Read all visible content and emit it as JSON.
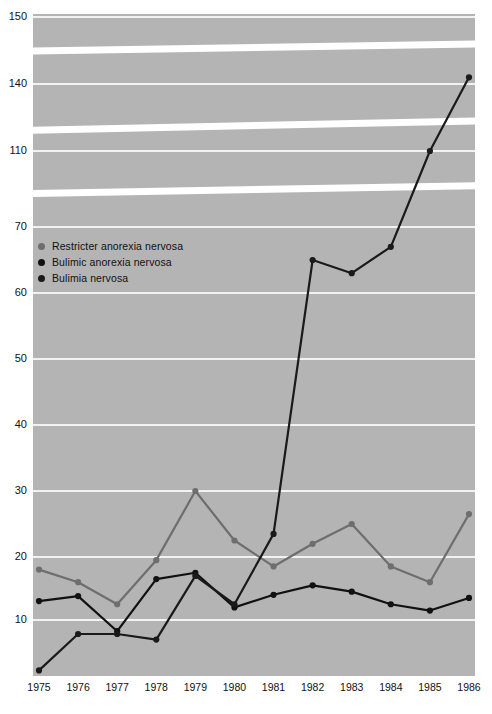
{
  "chart_data": {
    "type": "line",
    "title": "",
    "subtitle": "",
    "xlabel": "",
    "ylabel": "",
    "x": [
      1975,
      1976,
      1977,
      1978,
      1979,
      1980,
      1981,
      1982,
      1983,
      1984,
      1985,
      1986
    ],
    "categories": [
      "1975",
      "1976",
      "1977",
      "1978",
      "1979",
      "1980",
      "1981",
      "1982",
      "1983",
      "1984",
      "1985",
      "1986"
    ],
    "yticks": [
      10,
      20,
      30,
      40,
      50,
      60,
      70,
      110,
      140,
      150
    ],
    "ytick_labels": [
      "10",
      "20",
      "30",
      "40",
      "50",
      "60",
      "70",
      "110",
      "140",
      "150"
    ],
    "ylim": [
      0,
      150
    ],
    "axis_break": true,
    "axis_break_note": "y-axis is broken/compressed between 70 and 150",
    "grid": true,
    "legend_position": "upper-left-inside",
    "series": [
      {
        "name": "Restricter anorexia nervosa",
        "color": "#6e6e6e",
        "values": [
          18,
          16,
          12.5,
          19.5,
          30,
          22.5,
          18.5,
          22,
          25,
          18.5,
          16,
          26.5
        ]
      },
      {
        "name": "Bulimic anorexia nervosa",
        "color": "#111111",
        "values": [
          13,
          13.8,
          8,
          16.5,
          17.5,
          12,
          14,
          15.5,
          14.5,
          12.5,
          11.5,
          13.5
        ]
      },
      {
        "name": "Bulimia nervosa",
        "color": "#1a1a1a",
        "values": [
          1,
          7.5,
          7.5,
          6.5,
          17,
          12.5,
          23.5,
          65,
          63,
          67,
          110,
          141
        ]
      }
    ]
  },
  "legend": {
    "items": [
      {
        "label": "Restricter anorexia nervosa",
        "color": "#6e6e6e"
      },
      {
        "label": "Bulimic anorexia nervosa",
        "color": "#111111"
      },
      {
        "label": "Bulimia nervosa",
        "color": "#1a1a1a"
      }
    ]
  },
  "colors": {
    "plot_background": "#b4b4b4",
    "gridline": "#f2f2f2",
    "axis": "#ffffff",
    "text": "#111111"
  }
}
